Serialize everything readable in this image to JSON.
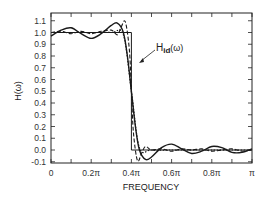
{
  "chart_data": {
    "type": "line",
    "title": "",
    "xlabel": "FREQUENCY",
    "ylabel": "H(ω)",
    "xlim": [
      0,
      3.14159
    ],
    "ylim": [
      -0.12,
      1.16
    ],
    "grid": false,
    "x_ticks": [
      "0",
      "0.2π",
      "0.4π",
      "0.6π",
      "0.8π",
      "π"
    ],
    "y_ticks": [
      "1.1",
      "1.0",
      "0.9",
      "0.8",
      "0.7",
      "0.6",
      "0.5",
      "0.4",
      "0.3",
      "0.2",
      "0.1",
      "0.0",
      "-0.1"
    ],
    "annotations": [
      {
        "text": "H",
        "subscript": "id",
        "suffix": "(ω)",
        "points_to": "ideal response edge at 0.4π"
      }
    ],
    "series": [
      {
        "name": "Ideal H_id(ω)",
        "style": "solid-thin",
        "x_frac_pi": [
          0,
          0.4,
          0.4,
          1.0
        ],
        "values": [
          1.0,
          1.0,
          0.0,
          0.0
        ]
      },
      {
        "name": "Response (solid)",
        "style": "solid",
        "x_frac_pi": [
          0,
          0.05,
          0.1,
          0.15,
          0.2,
          0.25,
          0.3,
          0.33,
          0.36,
          0.38,
          0.4,
          0.42,
          0.44,
          0.47,
          0.5,
          0.55,
          0.6,
          0.65,
          0.7,
          0.75,
          0.8,
          0.85,
          0.9,
          0.95,
          1.0
        ],
        "values": [
          0.97,
          1.02,
          1.04,
          0.99,
          0.95,
          0.99,
          1.06,
          1.08,
          1.0,
          0.8,
          0.5,
          0.2,
          0.0,
          -0.08,
          -0.06,
          0.02,
          0.05,
          0.01,
          -0.03,
          -0.01,
          0.03,
          0.02,
          -0.02,
          -0.02,
          0.01
        ]
      },
      {
        "name": "Response (dashed)",
        "style": "dashed",
        "x_frac_pi": [
          0,
          0.05,
          0.1,
          0.15,
          0.2,
          0.25,
          0.3,
          0.33,
          0.35,
          0.37,
          0.39,
          0.4,
          0.41,
          0.43,
          0.45,
          0.47,
          0.5,
          0.55,
          0.6,
          0.65,
          0.7,
          0.75,
          0.8,
          0.85,
          0.9,
          0.95,
          1.0
        ],
        "values": [
          1.0,
          1.01,
          0.99,
          1.01,
          0.99,
          1.01,
          1.02,
          0.98,
          1.05,
          1.09,
          0.85,
          0.5,
          0.15,
          -0.09,
          -0.03,
          0.03,
          0.0,
          0.01,
          -0.01,
          0.01,
          0.0,
          0.01,
          -0.01,
          0.0,
          0.01,
          -0.01,
          0.0
        ]
      },
      {
        "name": "Response (dotted)",
        "style": "dotted",
        "x_frac_pi": [
          0,
          0.1,
          0.2,
          0.3,
          0.36,
          0.4,
          0.44,
          0.5,
          0.6,
          0.7,
          0.8,
          0.9,
          1.0
        ],
        "values": [
          1.0,
          1.0,
          1.0,
          1.0,
          0.98,
          0.5,
          0.02,
          0.0,
          0.0,
          0.0,
          0.0,
          0.0,
          0.0
        ]
      }
    ]
  },
  "labels": {
    "xlabel": "FREQUENCY",
    "ylabel": "H(ω)",
    "annotation_main": "H",
    "annotation_sub": "id",
    "annotation_suffix": "(ω)"
  }
}
